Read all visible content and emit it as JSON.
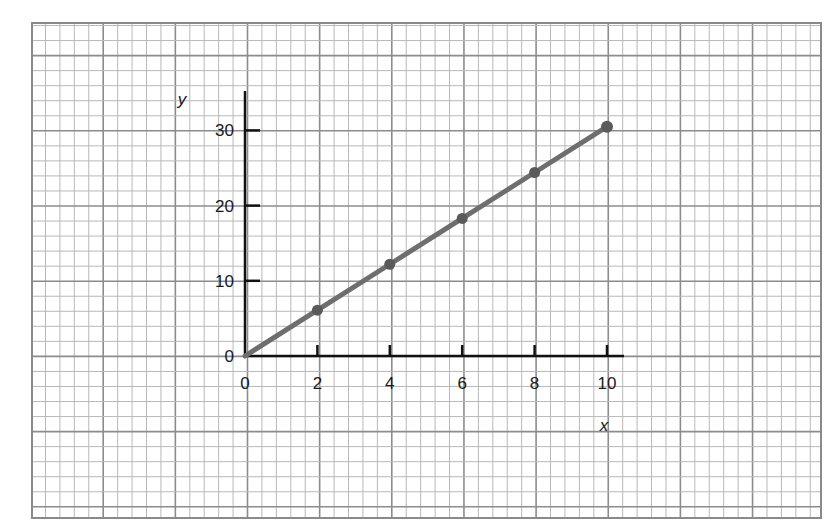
{
  "chart_data": {
    "type": "line",
    "title": "",
    "xlabel": "x",
    "ylabel": "y",
    "x": [
      0,
      2,
      4,
      6,
      8,
      10
    ],
    "series": [
      {
        "name": "y vs x",
        "values": [
          0,
          6.1,
          12.2,
          18.3,
          24.4,
          30.5
        ],
        "color": "#6e6e6e"
      }
    ],
    "xticks": [
      "0",
      "2",
      "4",
      "6",
      "8",
      "10"
    ],
    "yticks": [
      "0",
      "10",
      "20",
      "30"
    ],
    "xlim": [
      0,
      10.5
    ],
    "ylim": [
      0,
      35
    ],
    "grid": true,
    "background": "graph paper",
    "legend": null
  },
  "colors": {
    "grid_minor": "#b8b8b8",
    "grid_major": "#8c8c8c",
    "axis": "#111111",
    "line": "#6e6e6e"
  }
}
